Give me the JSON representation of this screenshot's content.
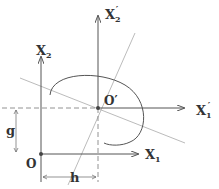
{
  "diagram": {
    "labels": {
      "x1": "X",
      "x1_sub": "1",
      "x2": "X",
      "x2_sub": "2",
      "x1p": "X",
      "x1p_sub": "1",
      "x1p_prime": "′",
      "x2p": "X",
      "x2p_sub": "2",
      "x2p_prime": "′",
      "origin": "O",
      "origin_prime": "O′",
      "h": "h",
      "g": "g"
    },
    "colors": {
      "line": "#555555",
      "light_line": "#aaaaaa",
      "background": "#ffffff"
    }
  }
}
